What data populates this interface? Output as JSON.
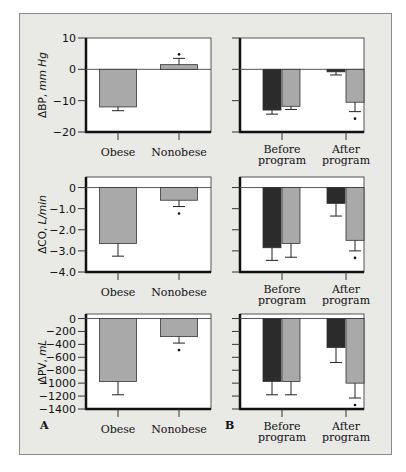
{
  "panel_labels": {
    "a": "A",
    "b": "B"
  },
  "colors": {
    "background": "#e9e9e6",
    "plot_bg": "#ffffff",
    "dark_bar": "#2b2b2b",
    "light_bar": "#a9a9a9",
    "axis": "#111111"
  },
  "chart_data": [
    {
      "id": "A1",
      "type": "bar",
      "title": "",
      "ylabel": "ΔBP, mm Hg",
      "ylabel_main": "ΔBP, ",
      "ylabel_unit": "mm Hg",
      "xlabel": "",
      "ylim": [
        -20,
        10
      ],
      "yticks": [
        10,
        0,
        -10,
        -20
      ],
      "ytick_labels": [
        "10",
        "0",
        "−10",
        "−20"
      ],
      "categories": [
        "Obese",
        "Nonobese"
      ],
      "series": [
        {
          "name": "change",
          "color": "light",
          "values": [
            -12,
            1.5
          ],
          "error": [
            -13.2,
            3.5
          ],
          "significant": [
            false,
            true
          ]
        }
      ]
    },
    {
      "id": "B1",
      "type": "bar",
      "title": "",
      "ylabel": "",
      "ylim": [
        -20,
        10
      ],
      "yticks": [
        10,
        0,
        -10,
        -20
      ],
      "categories": [
        "Before program",
        "After program"
      ],
      "series": [
        {
          "name": "dark",
          "color": "dark",
          "values": [
            -13,
            -0.8
          ],
          "error": [
            -14.3,
            -1.8
          ],
          "significant": [
            false,
            false
          ]
        },
        {
          "name": "light",
          "color": "light",
          "values": [
            -11.8,
            -10.5
          ],
          "error": [
            -12.8,
            -13.5
          ],
          "significant": [
            false,
            true
          ]
        }
      ]
    },
    {
      "id": "A2",
      "type": "bar",
      "title": "",
      "ylabel": "ΔCO, L/min",
      "ylabel_main": "ΔCO, ",
      "ylabel_unit": "L/min",
      "ylim": [
        -4.0,
        0.5
      ],
      "yticks": [
        0,
        -1.0,
        -2.0,
        -3.0,
        -4.0
      ],
      "ytick_labels": [
        "0",
        "−1.0",
        "−2.0",
        "−3.0",
        "−4.0"
      ],
      "categories": [
        "Obese",
        "Nonobese"
      ],
      "series": [
        {
          "name": "change",
          "color": "light",
          "values": [
            -2.65,
            -0.6
          ],
          "error": [
            -3.25,
            -0.9
          ],
          "significant": [
            false,
            true
          ]
        }
      ]
    },
    {
      "id": "B2",
      "type": "bar",
      "title": "",
      "ylabel": "",
      "ylim": [
        -4.0,
        0.5
      ],
      "yticks": [
        0,
        -1.0,
        -2.0,
        -3.0,
        -4.0
      ],
      "categories": [
        "Before program",
        "After program"
      ],
      "series": [
        {
          "name": "dark",
          "color": "dark",
          "values": [
            -2.85,
            -0.75
          ],
          "error": [
            -3.45,
            -1.35
          ],
          "significant": [
            false,
            false
          ]
        },
        {
          "name": "light",
          "color": "light",
          "values": [
            -2.65,
            -2.5
          ],
          "error": [
            -3.3,
            -3.0
          ],
          "significant": [
            false,
            true
          ]
        }
      ]
    },
    {
      "id": "A3",
      "type": "bar",
      "title": "",
      "ylabel": "ΔPV, mL",
      "ylabel_main": "ΔPV, ",
      "ylabel_unit": "mL",
      "ylim": [
        -1400,
        70
      ],
      "yticks": [
        0,
        -200,
        -400,
        -600,
        -800,
        -1000,
        -1200,
        -1400
      ],
      "ytick_labels": [
        "0",
        "−200",
        "−400",
        "−600",
        "−800",
        "−1000",
        "−1200",
        "−1400"
      ],
      "categories": [
        "Obese",
        "Nonobese"
      ],
      "series": [
        {
          "name": "change",
          "color": "light",
          "values": [
            -975,
            -280
          ],
          "error": [
            -1180,
            -380
          ],
          "significant": [
            false,
            true
          ]
        }
      ]
    },
    {
      "id": "B3",
      "type": "bar",
      "title": "",
      "ylabel": "",
      "ylim": [
        -1400,
        70
      ],
      "yticks": [
        0,
        -200,
        -400,
        -600,
        -800,
        -1000,
        -1200,
        -1400
      ],
      "categories": [
        "Before program",
        "After program"
      ],
      "series": [
        {
          "name": "dark",
          "color": "dark",
          "values": [
            -975,
            -450
          ],
          "error": [
            -1180,
            -680
          ],
          "significant": [
            false,
            false
          ]
        },
        {
          "name": "light",
          "color": "light",
          "values": [
            -975,
            -1000
          ],
          "error": [
            -1180,
            -1230
          ],
          "significant": [
            false,
            true
          ]
        }
      ]
    }
  ],
  "x_labels": {
    "obese": "Obese",
    "nonobese": "Nonobese",
    "before_line1": "Before",
    "before_line2": "program",
    "after_line1": "After",
    "after_line2": "program"
  },
  "significance_marker": "*"
}
